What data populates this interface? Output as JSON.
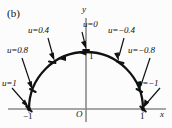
{
  "figure": {
    "panel_label": "(b)",
    "axes": {
      "x_axis_label": "x",
      "y_axis_label": "y",
      "origin_label": "O",
      "x_ticks": [
        {
          "value": -1,
          "label": "−1"
        },
        {
          "value": 1,
          "label": "1"
        }
      ],
      "y_ticks": [
        {
          "value": 1,
          "label": "1"
        }
      ],
      "xlim": [
        -1.45,
        1.45
      ],
      "ylim": [
        -0.25,
        1.35
      ]
    },
    "curve": {
      "type": "semicircle",
      "description": "upper unit semicircle traversed from u=1 at (-1,0) through u=0 at (0,1) to u=-1 at (1,0)",
      "radius": 1,
      "center": [
        0,
        0
      ],
      "direction_arrows": 2,
      "direction": "left"
    },
    "annotations": [
      {
        "label": "u=1",
        "u": 1.0,
        "point": [
          -1.0,
          0.0
        ],
        "side": "left"
      },
      {
        "label": "u=0.8",
        "u": 0.8,
        "point": [
          -0.951,
          0.309
        ],
        "side": "left"
      },
      {
        "label": "u=0.4",
        "u": 0.4,
        "point": [
          -0.588,
          0.809
        ],
        "side": "left"
      },
      {
        "label": "u=0",
        "u": 0.0,
        "point": [
          0.0,
          1.0
        ],
        "side": "top"
      },
      {
        "label": "u=−0.4",
        "u": -0.4,
        "point": [
          0.588,
          0.809
        ],
        "side": "right"
      },
      {
        "label": "u=−0.8",
        "u": -0.8,
        "point": [
          0.951,
          0.309
        ],
        "side": "right"
      },
      {
        "label": "u=−1",
        "u": -1.0,
        "point": [
          1.0,
          0.0
        ],
        "side": "right"
      }
    ],
    "colors": {
      "curve": "#111111",
      "axis": "#8a8a8a",
      "leader": "#111111",
      "background": "#fcfcfc"
    }
  }
}
